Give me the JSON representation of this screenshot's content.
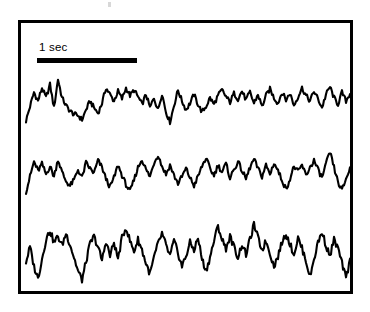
{
  "figure": {
    "kind": "electrophysiology-recording-panel",
    "background_color": "#ffffff",
    "ink_color": "#000000",
    "frame": {
      "border_color": "#000000",
      "border_width_px": 3,
      "x": 18,
      "y": 20,
      "width": 335,
      "height": 274
    },
    "scale_bar": {
      "label": "1 sec",
      "bar_color": "#000000",
      "bar_length_px": 100,
      "bar_thickness_px": 5,
      "represents_seconds": 1
    },
    "artifact": {
      "name": "scan-speck",
      "color": "#d8d8d8"
    }
  },
  "chart_data": {
    "type": "line",
    "title": "",
    "subtitle": "",
    "xlabel": "",
    "ylabel": "",
    "grid": false,
    "legend": null,
    "annotations": [
      {
        "text": "1 sec",
        "role": "time-scale-bar",
        "x_span_units": 1.0
      }
    ],
    "axis_note": "No numeric axes drawn; horizontal axis is time calibrated by the 1 sec scale bar, vertical axis is uncalibrated amplitude.",
    "xlim": [
      0,
      3.28
    ],
    "ylim": [
      -1,
      1
    ],
    "x_units": "seconds",
    "series": [
      {
        "name": "trace-1",
        "baseline_y_px": 100,
        "amplitude_px": 22,
        "color": "#000000",
        "points": "5,-0.95 9,-0.30 13,0.35 17,-0.05 21,0.55 25,0.10 29,0.70 33,-0.35 37,0.95 41,0.10 45,-0.25 49,-0.50 53,-0.65 57,-0.70 61,-0.90 65,-0.45 69,-0.05 73,-0.35 77,-0.60 81,-0.15 85,0.55 89,0.25 93,-0.05 97,0.40 101,0.05 105,0.55 109,0.20 113,0.45 117,0.15 121,-0.20 125,0.25 129,-0.35 133,0.10 137,-0.45 141,0.30 145,-0.55 149,-1.00 153,-0.25 157,0.45 161,-0.05 165,-0.45 169,-0.15 173,0.25 177,-0.20 181,-0.55 185,-0.30 189,0.10 193,-0.20 197,0.20 201,0.45 205,0.15 209,-0.10 213,0.30 217,0.05 221,0.40 225,0.00 229,0.35 233,-0.15 237,0.25 241,-0.30 245,0.20 249,0.50 253,0.10 257,-0.15 261,0.35 265,0.00 269,0.30 273,-0.25 277,0.15 281,0.55 285,0.20 289,-0.05 293,0.40 297,0.05 301,-0.35 305,0.25 309,0.60 313,0.10 317,-0.20 321,0.35 325,-0.05 329,0.30 333,-0.40 337,0.10 341,0.55 345,0.05 349,-0.10"
      },
      {
        "name": "trace-2",
        "baseline_y_px": 172,
        "amplitude_px": 23,
        "color": "#000000",
        "points": "5,-0.85 9,-0.20 13,0.45 17,0.05 21,0.35 25,-0.10 29,0.25 33,-0.20 37,0.55 41,0.00 45,-0.40 49,-0.60 53,-0.35 57,0.10 61,-0.25 65,0.40 69,0.15 73,-0.05 77,0.50 81,0.20 85,-0.30 89,-0.65 93,-0.25 97,0.30 101,-0.15 105,-0.55 109,-0.85 113,-0.35 117,0.20 121,0.55 125,0.10 129,-0.20 133,0.40 137,0.75 141,0.25 145,-0.10 149,0.30 153,-0.15 157,-0.50 161,-0.20 165,0.15 169,-0.25 173,-0.60 177,-0.20 181,0.25 185,0.60 189,0.15 193,-0.15 197,0.30 201,0.00 205,0.35 209,-0.25 213,0.10 217,0.45 221,0.05 225,-0.30 229,0.20 233,0.55 237,0.15 241,-0.20 245,0.30 249,-0.10 253,0.40 257,0.05 261,-0.35 265,-0.75 269,-0.30 273,0.25 277,0.00 281,0.30 285,-0.15 289,0.20 293,0.50 297,0.10 301,-0.25 305,0.35 309,0.85 313,0.20 317,-0.45 321,-0.80 325,-0.30 329,0.15 333,0.45 337,0.05 341,-0.20 345,0.25 349,0.10"
      },
      {
        "name": "trace-3",
        "baseline_y_px": 250,
        "amplitude_px": 30,
        "color": "#000000",
        "points": "5,-0.40 9,0.10 13,-0.55 17,-0.95 21,-0.30 25,0.35 29,0.65 33,0.25 37,0.45 41,0.15 45,0.55 49,0.20 53,-0.25 57,-0.70 61,-1.00 65,-0.40 69,0.20 73,0.45 77,0.10 81,-0.35 85,0.30 89,-0.20 93,0.25 97,-0.30 101,0.40 105,0.75 109,0.30 113,-0.05 117,0.35 121,0.00 125,-0.45 129,-0.80 133,-0.25 137,0.20 141,0.55 145,0.15 149,-0.20 153,0.30 157,-0.10 161,-0.55 165,-0.20 169,0.25 173,0.00 177,0.40 181,-0.30 185,-0.70 189,-0.25 193,0.30 197,0.80 201,0.35 205,0.05 209,0.45 213,0.10 217,-0.25 221,0.20 225,-0.15 229,0.35 233,0.85 237,0.40 241,0.00 245,0.30 249,-0.10 253,-0.55 257,-0.20 261,0.25 265,0.55 269,0.20 273,-0.15 277,0.40 281,0.05 285,-0.35 289,-0.90 293,-0.30 297,0.25 301,0.60 305,0.15 309,-0.20 313,0.35 317,0.05 321,-0.45 325,-0.95 329,-0.35 333,0.30 337,0.70 341,0.25 345,-0.10 349,0.15"
      }
    ]
  }
}
